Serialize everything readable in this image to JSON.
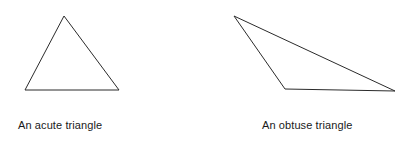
{
  "figure": {
    "width": 415,
    "height": 146,
    "background_color": "#ffffff",
    "stroke_color": "#2b2b2b",
    "stroke_width": 1,
    "fill": "none",
    "text_color": "#1a1a1a"
  },
  "diagram_data": {
    "type": "geometry-diagram",
    "title": "",
    "shapes": [
      {
        "id": "acute-triangle",
        "kind": "triangle",
        "classification": "acute",
        "caption": "An acute triangle",
        "vertices": [
          {
            "label": "apex",
            "x": 64,
            "y": 16
          },
          {
            "label": "bottom-right",
            "x": 119,
            "y": 90
          },
          {
            "label": "bottom-left",
            "x": 25,
            "y": 90
          }
        ],
        "points_attr": "64,16 119,90 25,90"
      },
      {
        "id": "obtuse-triangle",
        "kind": "triangle",
        "classification": "obtuse",
        "caption": "An obtuse triangle",
        "vertices": [
          {
            "label": "top-left",
            "x": 234,
            "y": 16
          },
          {
            "label": "right",
            "x": 395,
            "y": 91
          },
          {
            "label": "obtuse-vertex",
            "x": 285,
            "y": 89
          }
        ],
        "points_attr": "234,16 395,91 285,89"
      }
    ]
  },
  "captions": {
    "acute": "An acute triangle",
    "obtuse": "An obtuse triangle"
  }
}
